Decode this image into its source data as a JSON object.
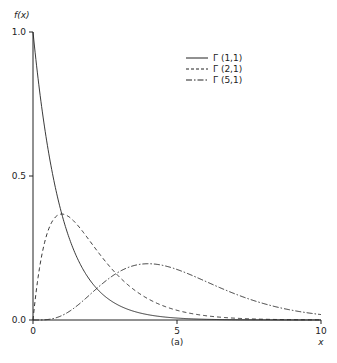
{
  "chart_data": {
    "type": "line",
    "title": "",
    "caption": "(a)",
    "xlabel": "x",
    "ylabel": "f(x)",
    "xlim": [
      0,
      10
    ],
    "ylim": [
      0,
      1.0
    ],
    "xticks": [
      "0",
      "5",
      "10"
    ],
    "yticks": [
      "0.0",
      "0.5",
      "1.0"
    ],
    "grid": false,
    "legend_position": "upper right",
    "series": [
      {
        "name": "Γ (1,1)",
        "style": "solid",
        "shape": 1,
        "scale": 1,
        "x": [
          0,
          0.5,
          1,
          1.5,
          2,
          3,
          4,
          5,
          6,
          8,
          10
        ],
        "values": [
          1.0,
          0.607,
          0.368,
          0.223,
          0.135,
          0.05,
          0.018,
          0.007,
          0.002,
          0.0003,
          5e-05
        ]
      },
      {
        "name": "Γ (2,1)",
        "style": "dashed",
        "shape": 2,
        "scale": 1,
        "x": [
          0,
          0.5,
          1,
          1.5,
          2,
          3,
          4,
          5,
          6,
          8,
          10
        ],
        "values": [
          0.0,
          0.303,
          0.368,
          0.335,
          0.271,
          0.149,
          0.073,
          0.034,
          0.015,
          0.003,
          0.0005
        ]
      },
      {
        "name": "Γ (5,1)",
        "style": "dashdot",
        "shape": 5,
        "scale": 1,
        "x": [
          0,
          1,
          2,
          3,
          4,
          5,
          6,
          7,
          8,
          9,
          10
        ],
        "values": [
          0.0,
          0.015,
          0.09,
          0.168,
          0.195,
          0.175,
          0.134,
          0.091,
          0.057,
          0.034,
          0.019
        ]
      }
    ]
  },
  "legend": {
    "items": [
      {
        "label": "Γ (1,1)"
      },
      {
        "label": "Γ (2,1)"
      },
      {
        "label": "Γ (5,1)"
      }
    ]
  },
  "axes": {
    "ylabel": "f(x)",
    "xlabel": "x",
    "caption": "(a)",
    "y_ticks": [
      "1.0",
      "0.5",
      "0.0"
    ],
    "x_ticks": [
      "0",
      "5",
      "10"
    ]
  }
}
